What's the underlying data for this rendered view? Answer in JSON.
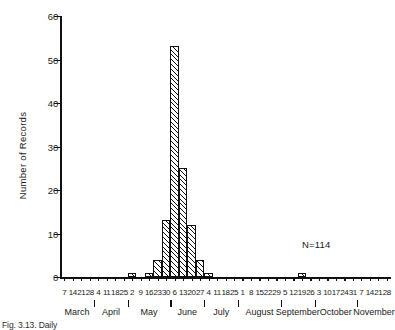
{
  "chart_data": {
    "type": "bar",
    "title": "",
    "xlabel": "",
    "ylabel": "Number of  Records",
    "ylim": [
      0,
      60
    ],
    "ytick_values": [
      0,
      10,
      20,
      30,
      40,
      50,
      60
    ],
    "ytick_labels": [
      "0",
      "10",
      "20",
      "30",
      "40",
      "50",
      "60"
    ],
    "grid": false,
    "legend": null,
    "annotations": [
      {
        "text": "N=114",
        "x": "September",
        "y": 6
      }
    ],
    "categories": [
      "Mar 7",
      "Mar 14",
      "Mar 21",
      "Mar 28",
      "Apr 4",
      "Apr 11",
      "Apr 18",
      "Apr 25",
      "May 2",
      "May 9",
      "May 16",
      "May 23",
      "May 30",
      "Jun 6",
      "Jun 13",
      "Jun 20",
      "Jun 27",
      "Jul 4",
      "Jul 11",
      "Jul 18",
      "Jul 25",
      "Aug 1",
      "Aug 8",
      "Aug 15",
      "Aug 22",
      "Aug 29",
      "Sep 5",
      "Sep 12",
      "Sep 19",
      "Sep 26",
      "Oct 3",
      "Oct 10",
      "Oct 17",
      "Oct 24",
      "Oct 31",
      "Nov 7",
      "Nov 14",
      "Nov 21",
      "Nov 28"
    ],
    "values": [
      0,
      0,
      0,
      0,
      0,
      0,
      0,
      0,
      1,
      0,
      1,
      4,
      13,
      53,
      25,
      12,
      4,
      1,
      0,
      0,
      0,
      0,
      0,
      0,
      0,
      0,
      0,
      0,
      1,
      0,
      0,
      0,
      0,
      0,
      0,
      0,
      0,
      0,
      0
    ],
    "xtick_labels": [
      "7",
      "14",
      "21",
      "28",
      "4",
      "11",
      "18",
      "25",
      "2",
      "9",
      "16",
      "23",
      "30",
      "6",
      "13",
      "20",
      "27",
      "4",
      "11",
      "18",
      "25",
      "1",
      "8",
      "15",
      "22",
      "29",
      "5",
      "12",
      "19",
      "26",
      "3",
      "10",
      "17",
      "24",
      "31",
      "7",
      "14",
      "21",
      "28"
    ],
    "months": [
      "March",
      "April",
      "May",
      "June",
      "July",
      "August",
      "September",
      "October",
      "November"
    ]
  },
  "figure": {
    "caption": "Fig. 3.13.  Daily"
  },
  "colors": {
    "axis": "#111111",
    "bar_outline": "#111111",
    "bar_fill": "#ffffff",
    "hatch": "#111111",
    "background": "#ffffff"
  }
}
